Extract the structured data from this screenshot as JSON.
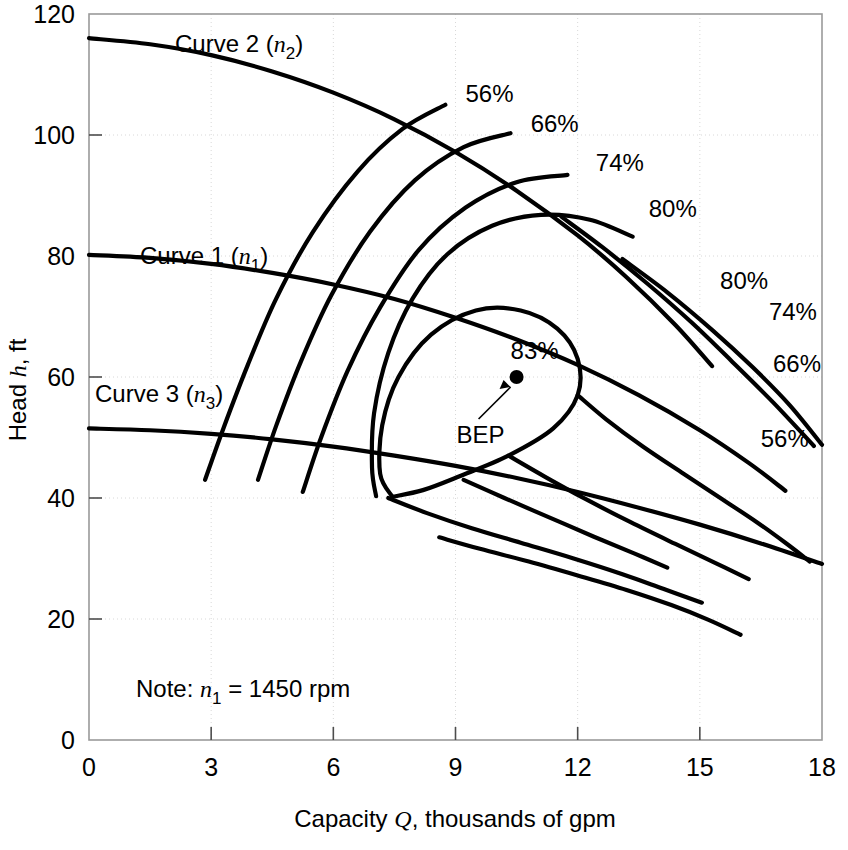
{
  "chart_data": {
    "type": "line",
    "title": "",
    "xlabel": "Capacity Q, thousands of gpm",
    "ylabel": "Head h, ft",
    "xlim": [
      0,
      18
    ],
    "ylim": [
      0,
      120
    ],
    "xticks": [
      0,
      3,
      6,
      9,
      12,
      15,
      18
    ],
    "yticks": [
      0,
      20,
      40,
      60,
      80,
      100,
      120
    ],
    "grid": true,
    "legend_position": "inline-labels",
    "note": "Note: n₁ = 1450 rpm",
    "note_parts": {
      "prefix": "Note: ",
      "symbol": "n",
      "subscript": "1",
      "value": " = 1450 rpm"
    },
    "bep": {
      "label": "BEP",
      "efficiency_label": "83%",
      "q": 10.5,
      "h": 60.0
    },
    "series": [
      {
        "name": "Curve 2 (n2)",
        "label": "Curve 2",
        "sub": "2",
        "speed_symbol": "n",
        "points": [
          [
            0,
            116.0
          ],
          [
            1.5,
            115.0
          ],
          [
            3,
            113.2
          ],
          [
            4.5,
            110.5
          ],
          [
            6,
            107.0
          ],
          [
            7.5,
            102.6
          ],
          [
            9,
            97.2
          ],
          [
            10.5,
            90.8
          ],
          [
            12,
            83.4
          ],
          [
            13.2,
            76.5
          ],
          [
            14.4,
            68.6
          ],
          [
            15.3,
            61.8
          ]
        ]
      },
      {
        "name": "Curve 1 (n1)",
        "label": "Curve 1",
        "sub": "1",
        "speed_symbol": "n",
        "points": [
          [
            0,
            80.2
          ],
          [
            1.5,
            79.7
          ],
          [
            3,
            78.7
          ],
          [
            4.5,
            77.2
          ],
          [
            6,
            75.3
          ],
          [
            7.5,
            72.9
          ],
          [
            9,
            69.8
          ],
          [
            10.5,
            66.2
          ],
          [
            12,
            62.0
          ],
          [
            13.5,
            57.0
          ],
          [
            15,
            51.2
          ],
          [
            16.2,
            45.8
          ],
          [
            17.1,
            41.2
          ]
        ]
      },
      {
        "name": "Curve 3 (n3)",
        "label": "Curve 3",
        "sub": "3",
        "speed_symbol": "n",
        "points": [
          [
            0,
            51.5
          ],
          [
            1.5,
            51.2
          ],
          [
            3,
            50.6
          ],
          [
            4.5,
            49.7
          ],
          [
            6,
            48.5
          ],
          [
            7.5,
            47.0
          ],
          [
            9,
            45.3
          ],
          [
            10.5,
            43.3
          ],
          [
            12,
            41.0
          ],
          [
            13.5,
            38.4
          ],
          [
            15,
            35.6
          ],
          [
            16.5,
            32.5
          ],
          [
            18,
            29.1
          ]
        ]
      }
    ],
    "efficiency_contours": [
      {
        "value": "56%",
        "label_upper": "56%",
        "label_lower": "56%",
        "upper_anchor": [
          9.0,
          104.5
        ],
        "lower_anchor": [
          16.3,
          47.5
        ],
        "points": [
          [
            2.85,
            43.0
          ],
          [
            3.3,
            51.5
          ],
          [
            3.9,
            62.0
          ],
          [
            4.6,
            73.0
          ],
          [
            5.5,
            84.0
          ],
          [
            6.6,
            94.0
          ],
          [
            7.7,
            101.0
          ],
          [
            8.75,
            105.0
          ]
        ]
      },
      {
        "value": "66%",
        "label_upper": "66%",
        "label_lower": "66%",
        "upper_anchor": [
          10.6,
          99.5
        ],
        "lower_anchor": [
          16.6,
          59.8
        ],
        "points": [
          [
            4.15,
            43.0
          ],
          [
            4.6,
            52.0
          ],
          [
            5.2,
            62.5
          ],
          [
            5.95,
            73.5
          ],
          [
            6.9,
            84.0
          ],
          [
            8.0,
            92.5
          ],
          [
            9.2,
            98.0
          ],
          [
            10.35,
            100.3
          ]
        ]
      },
      {
        "value": "74%",
        "label_upper": "74%",
        "label_lower": "74%",
        "upper_anchor": [
          12.2,
          93.0
        ],
        "lower_anchor": [
          16.5,
          68.5
        ],
        "points": [
          [
            5.25,
            41.0
          ],
          [
            5.7,
            50.0
          ],
          [
            6.35,
            61.0
          ],
          [
            7.15,
            71.5
          ],
          [
            8.1,
            81.0
          ],
          [
            9.25,
            88.0
          ],
          [
            10.5,
            92.2
          ],
          [
            11.75,
            93.4
          ]
        ]
      },
      {
        "value": "80%",
        "label_upper": "80%",
        "label_lower": "80%",
        "upper_anchor": [
          13.5,
          85.5
        ],
        "lower_anchor": [
          15.3,
          73.5
        ],
        "points": [
          [
            7.05,
            40.3
          ],
          [
            6.95,
            45.0
          ],
          [
            7.0,
            54.0
          ],
          [
            7.35,
            64.0
          ],
          [
            7.95,
            73.0
          ],
          [
            8.8,
            80.3
          ],
          [
            9.9,
            85.0
          ],
          [
            11.1,
            86.8
          ],
          [
            12.3,
            86.0
          ],
          [
            13.35,
            83.2
          ]
        ]
      },
      {
        "value": "83%",
        "label": "83%",
        "closed_loop": true,
        "points": [
          [
            7.45,
            40.2
          ],
          [
            7.15,
            44.0
          ],
          [
            7.2,
            52.0
          ],
          [
            7.6,
            60.0
          ],
          [
            8.4,
            67.0
          ],
          [
            9.5,
            71.0
          ],
          [
            10.6,
            71.0
          ],
          [
            11.5,
            68.0
          ],
          [
            12.0,
            63.0
          ],
          [
            12.0,
            57.0
          ],
          [
            11.4,
            51.5
          ],
          [
            10.3,
            47.0
          ],
          [
            9.1,
            43.6
          ],
          [
            8.2,
            41.3
          ],
          [
            7.45,
            40.2
          ]
        ]
      }
    ],
    "efficiency_downlines": [
      {
        "value": "80%",
        "points": [
          [
            7.35,
            40.0
          ],
          [
            8.3,
            37.5
          ],
          [
            9.4,
            35.0
          ],
          [
            10.6,
            32.6
          ],
          [
            11.9,
            30.0
          ],
          [
            13.1,
            27.4
          ],
          [
            14.1,
            25.0
          ],
          [
            15.05,
            22.7
          ]
        ]
      },
      {
        "value": "74%",
        "points": [
          [
            8.6,
            33.5
          ],
          [
            9.6,
            31.6
          ],
          [
            10.8,
            29.5
          ],
          [
            12.0,
            27.2
          ],
          [
            13.2,
            24.8
          ],
          [
            14.3,
            22.3
          ],
          [
            15.2,
            19.9
          ],
          [
            16.0,
            17.4
          ]
        ]
      }
    ],
    "efficiency_lower_branches": [
      {
        "value": "80%-lower",
        "points": [
          [
            12.0,
            57.0
          ],
          [
            12.7,
            53.0
          ],
          [
            13.6,
            48.5
          ],
          [
            14.6,
            44.0
          ],
          [
            15.55,
            39.8
          ],
          [
            16.4,
            36.0
          ],
          [
            17.1,
            32.6
          ],
          [
            17.7,
            29.5
          ]
        ]
      },
      {
        "value": "74%-lower",
        "points": [
          [
            10.3,
            47.0
          ],
          [
            11.2,
            43.5
          ],
          [
            12.2,
            39.8
          ],
          [
            13.3,
            36.0
          ],
          [
            14.4,
            32.4
          ],
          [
            15.4,
            29.2
          ],
          [
            16.2,
            26.6
          ]
        ]
      },
      {
        "value": "66%-lower",
        "points": [
          [
            9.2,
            43.0
          ],
          [
            10.2,
            40.0
          ],
          [
            11.3,
            36.8
          ],
          [
            12.4,
            33.6
          ],
          [
            13.4,
            30.8
          ],
          [
            14.2,
            28.5
          ]
        ]
      }
    ],
    "efficiency_right_tails": [
      {
        "value": "66%-tail",
        "points": [
          [
            13.1,
            79.5
          ],
          [
            14.2,
            74.0
          ],
          [
            15.3,
            67.8
          ],
          [
            16.3,
            61.6
          ],
          [
            17.2,
            55.4
          ],
          [
            18.0,
            48.8
          ]
        ]
      },
      {
        "value": "56%-tail",
        "points": [
          [
            11.6,
            86.5
          ],
          [
            12.6,
            81.5
          ],
          [
            13.7,
            75.5
          ],
          [
            14.8,
            69.0
          ],
          [
            15.8,
            62.5
          ],
          [
            16.8,
            55.8
          ],
          [
            17.8,
            48.6
          ]
        ]
      }
    ]
  }
}
